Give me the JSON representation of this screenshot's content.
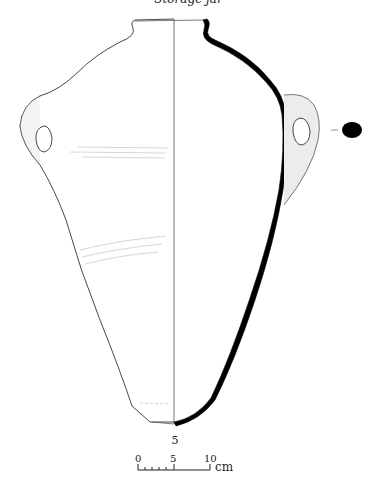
{
  "figure": {
    "caption": "Storage jar",
    "catalogue_number": "5",
    "colors": {
      "line": "#222222",
      "section_fill": "#000000",
      "handle_shade": "#cccccc"
    }
  },
  "scale_bar": {
    "labels": [
      "0",
      "5",
      "10"
    ],
    "unit": "cm"
  }
}
